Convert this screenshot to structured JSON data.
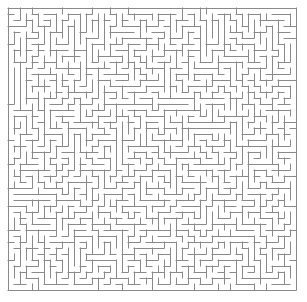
{
  "figure": {
    "kind": "maze-puzzle",
    "title": "Maze",
    "width_px": 307,
    "height_px": 302,
    "background_color": "#ffffff"
  },
  "maze": {
    "columns": 48,
    "rows": 47,
    "cell_size_px": 6,
    "origin_x_px": 8,
    "origin_y_px": 8,
    "wall_color": "#8a8a8a",
    "wall_thickness_px": 1,
    "passage_color": "#ffffff",
    "border_closed": true,
    "type": "perfect-maze",
    "generator": "depth-first-search",
    "seed": 20240617,
    "entrance": "none-visible",
    "exit": "none-visible",
    "description": "Dense rectangular perfect maze of thin grey walls on a white background, fully enclosed by a continuous outer border."
  },
  "chart_data": {
    "type": "maze",
    "title": "Maze",
    "grid": {
      "columns": 48,
      "rows": 47,
      "cell_size": 6
    },
    "xlim": [
      0,
      48
    ],
    "ylim": [
      0,
      47
    ],
    "grid_lines": false,
    "legend": "none"
  }
}
